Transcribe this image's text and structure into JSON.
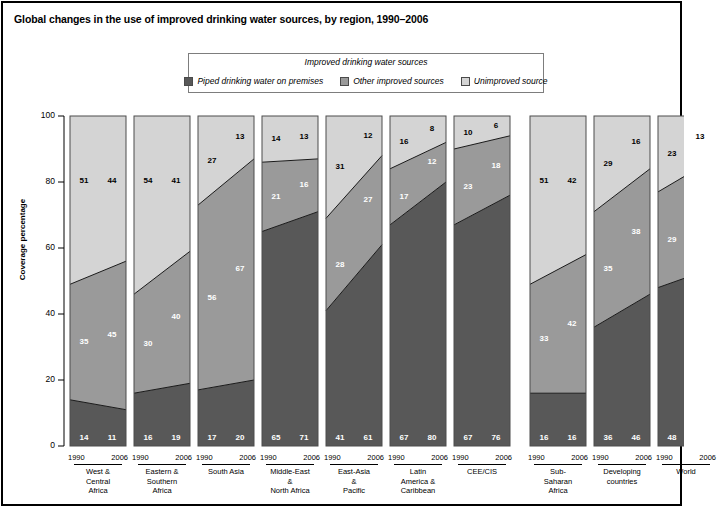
{
  "title": "Global changes in the use of improved drinking water sources, by region, 1990–2006",
  "legend": {
    "heading": "Improved drinking water sources",
    "items": [
      {
        "label": "Piped drinking water on premises",
        "icon": "square-swatch-dark",
        "color": "#585858"
      },
      {
        "label": "Other improved sources",
        "icon": "square-swatch-mid",
        "color": "#9a9a9a"
      },
      {
        "label": "Unimproved source",
        "icon": "square-swatch-light",
        "color": "#d4d4d4"
      }
    ]
  },
  "axis": {
    "ylabel": "Coverage percentage",
    "yticks": [
      "100",
      "80",
      "60",
      "40",
      "20",
      "0"
    ],
    "years": [
      "1990",
      "2006"
    ]
  },
  "chart_data": {
    "type": "area",
    "title": "Global changes in the use of improved drinking water sources, by region, 1990–2006",
    "xlabel": "",
    "ylabel": "Coverage percentage",
    "ylim": [
      0,
      100
    ],
    "grid": false,
    "legend_position": "top-center",
    "x": [
      "1990",
      "2006"
    ],
    "categories": [
      "West & Central Africa",
      "Eastern & Southern Africa",
      "South Asia",
      "Middle-East & North Africa",
      "East-Asia & Pacific",
      "Latin America & Caribbean",
      "CEE/CIS",
      "Sub-Saharan Africa",
      "Developing countries",
      "World"
    ],
    "category_lines": [
      [
        "West &",
        "Central",
        "Africa"
      ],
      [
        "Eastern &",
        "Southern",
        "Africa"
      ],
      [
        "South Asia"
      ],
      [
        "Middle-East",
        "&",
        "North Africa"
      ],
      [
        "East-Asia",
        "&",
        "Pacific"
      ],
      [
        "Latin",
        "America &",
        "Caribbean"
      ],
      [
        "CEE/CIS"
      ],
      [
        "Sub-",
        "Saharan",
        "Africa"
      ],
      [
        "Developing",
        "countries"
      ],
      [
        "World"
      ]
    ],
    "series": [
      {
        "name": "Piped drinking water on premises",
        "color": "#585858",
        "values_1990": [
          14,
          16,
          17,
          65,
          41,
          67,
          67,
          16,
          36,
          48
        ],
        "values_2006": [
          11,
          19,
          20,
          71,
          61,
          80,
          76,
          16,
          46,
          54
        ]
      },
      {
        "name": "Other improved sources",
        "color": "#9a9a9a",
        "values_1990": [
          35,
          30,
          56,
          21,
          28,
          17,
          23,
          33,
          35,
          29
        ],
        "values_2006": [
          45,
          40,
          67,
          16,
          27,
          12,
          18,
          42,
          38,
          33
        ]
      },
      {
        "name": "Unimproved source",
        "color": "#d4d4d4",
        "values_1990": [
          51,
          54,
          27,
          14,
          31,
          16,
          10,
          51,
          29,
          23
        ],
        "values_2006": [
          44,
          41,
          13,
          13,
          12,
          8,
          6,
          42,
          16,
          13
        ]
      }
    ]
  }
}
